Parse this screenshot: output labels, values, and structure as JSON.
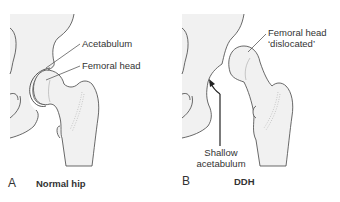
{
  "panels": [
    {
      "letter": "A",
      "title": "Normal hip",
      "labels": {
        "acetabulum": "Acetabulum",
        "femoral_head": "Femoral head"
      }
    },
    {
      "letter": "B",
      "title": "DDH",
      "labels": {
        "femoral_head_line1": "Femoral head",
        "femoral_head_line2": "‘dislocated’",
        "shallow_line1": "Shallow",
        "shallow_line2": "acetabulum"
      }
    }
  ],
  "colors": {
    "bone_fill": "#f1f1f1",
    "outline": "#444444",
    "text": "#333333"
  }
}
